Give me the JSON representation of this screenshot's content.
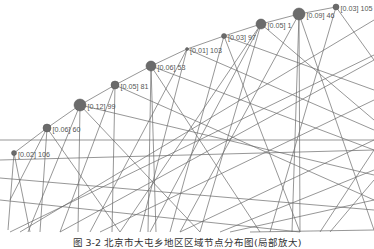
{
  "figure": {
    "caption": "图 3-2  北京市大屯乡地区区域节点分布图(局部放大)",
    "colors": {
      "node": "#6b6b6b",
      "edge": "#6a6a6a",
      "label": "#555555",
      "background": "#ffffff"
    }
  },
  "nodes": [
    {
      "id": 106,
      "label": "[0.02] 106",
      "weight": 0.02,
      "x": 14,
      "y": 153,
      "r": 2.5
    },
    {
      "id": 60,
      "label": "[0.06] 60",
      "weight": 0.06,
      "x": 47,
      "y": 128,
      "r": 4
    },
    {
      "id": 99,
      "label": "[0.12] 99",
      "weight": 0.12,
      "x": 80,
      "y": 105,
      "r": 6
    },
    {
      "id": 81,
      "label": "[0.05] 81",
      "weight": 0.05,
      "x": 115,
      "y": 85,
      "r": 4
    },
    {
      "id": 53,
      "label": "[0.06] 53",
      "weight": 0.06,
      "x": 151,
      "y": 66,
      "r": 5
    },
    {
      "id": 103,
      "label": "[0.01] 103",
      "weight": 0.01,
      "x": 187,
      "y": 49,
      "r": 1.5
    },
    {
      "id": 97,
      "label": "[0.03] 97",
      "weight": 0.03,
      "x": 224,
      "y": 36,
      "r": 2.5
    },
    {
      "id": 1,
      "label": "[0.05] 1",
      "weight": 0.05,
      "x": 261,
      "y": 24,
      "r": 5
    },
    {
      "id": 46,
      "label": "[0.09] 46",
      "weight": 0.09,
      "x": 299,
      "y": 14,
      "r": 6
    },
    {
      "id": 105,
      "label": "[0.03] 105",
      "weight": 0.03,
      "x": 336,
      "y": 7,
      "r": 3
    }
  ],
  "edges": [
    [
      14,
      153,
      47,
      128
    ],
    [
      47,
      128,
      80,
      105
    ],
    [
      80,
      105,
      115,
      85
    ],
    [
      115,
      85,
      151,
      66
    ],
    [
      151,
      66,
      187,
      49
    ],
    [
      187,
      49,
      224,
      36
    ],
    [
      224,
      36,
      261,
      24
    ],
    [
      261,
      24,
      299,
      14
    ],
    [
      299,
      14,
      336,
      7
    ],
    [
      14,
      153,
      8,
      230
    ],
    [
      14,
      153,
      30,
      232
    ],
    [
      47,
      128,
      10,
      200
    ],
    [
      47,
      128,
      40,
      232
    ],
    [
      47,
      128,
      120,
      232
    ],
    [
      80,
      105,
      78,
      232
    ],
    [
      80,
      105,
      28,
      232
    ],
    [
      80,
      105,
      374,
      175
    ],
    [
      80,
      105,
      200,
      232
    ],
    [
      115,
      85,
      112,
      232
    ],
    [
      115,
      85,
      374,
      200
    ],
    [
      115,
      85,
      60,
      232
    ],
    [
      151,
      66,
      148,
      232
    ],
    [
      151,
      66,
      156,
      232
    ],
    [
      151,
      66,
      260,
      232
    ],
    [
      151,
      66,
      374,
      150
    ],
    [
      187,
      49,
      140,
      232
    ],
    [
      187,
      49,
      90,
      232
    ],
    [
      187,
      49,
      374,
      130
    ],
    [
      224,
      36,
      300,
      232
    ],
    [
      224,
      36,
      374,
      90
    ],
    [
      224,
      36,
      170,
      232
    ],
    [
      261,
      24,
      150,
      232
    ],
    [
      261,
      24,
      200,
      232
    ],
    [
      261,
      24,
      120,
      232
    ],
    [
      261,
      24,
      374,
      120
    ],
    [
      299,
      14,
      292,
      232
    ],
    [
      299,
      14,
      300,
      232
    ],
    [
      299,
      14,
      374,
      230
    ],
    [
      299,
      14,
      180,
      232
    ],
    [
      336,
      7,
      270,
      232
    ],
    [
      336,
      7,
      374,
      60
    ],
    [
      0,
      178,
      374,
      210
    ],
    [
      0,
      200,
      300,
      232
    ],
    [
      0,
      160,
      374,
      150
    ],
    [
      20,
      232,
      374,
      20
    ],
    [
      60,
      232,
      374,
      60
    ],
    [
      100,
      232,
      374,
      100
    ],
    [
      180,
      232,
      374,
      140
    ],
    [
      220,
      232,
      374,
      170
    ],
    [
      0,
      140,
      374,
      140
    ],
    [
      10,
      232,
      374,
      55
    ],
    [
      230,
      232,
      374,
      200
    ],
    [
      250,
      232,
      374,
      230
    ],
    [
      330,
      232,
      374,
      180
    ],
    [
      320,
      232,
      374,
      150
    ]
  ]
}
